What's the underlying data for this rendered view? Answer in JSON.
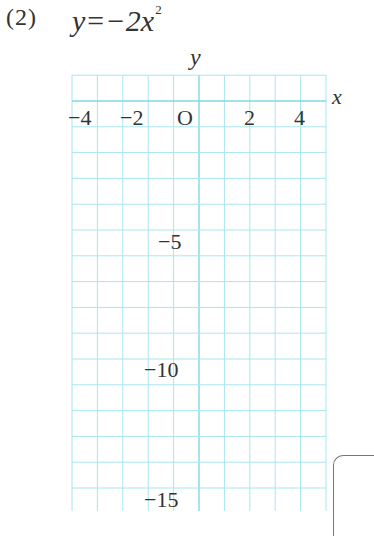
{
  "problem": {
    "number": "(2)",
    "equation_main": "y=−2x",
    "equation_exponent": "2"
  },
  "axes": {
    "x_label": "x",
    "y_label": "y",
    "origin_label": "O"
  },
  "colors": {
    "grid": "#a8e6ee",
    "axis": "#7fd8e4",
    "text": "#333333"
  },
  "chart_data": {
    "type": "line",
    "xlabel": "x",
    "ylabel": "y",
    "xlim": [
      -5,
      5
    ],
    "ylim": [
      -15.5,
      1
    ],
    "x_ticks": [
      {
        "value": -4,
        "label": "−4"
      },
      {
        "value": -2,
        "label": "−2"
      },
      {
        "value": 0,
        "label": "O"
      },
      {
        "value": 2,
        "label": "2"
      },
      {
        "value": 4,
        "label": "4"
      }
    ],
    "y_ticks": [
      {
        "value": -5,
        "label": "−5"
      },
      {
        "value": -10,
        "label": "−10"
      },
      {
        "value": -15,
        "label": "−15"
      }
    ],
    "grid": true,
    "series": [],
    "note": "Blank grid for graphing y = −2x²; no curve plotted"
  }
}
